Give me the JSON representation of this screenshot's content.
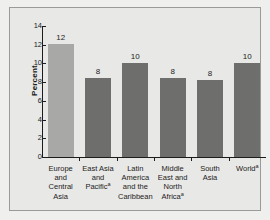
{
  "chart_data": {
    "type": "bar",
    "title": "",
    "xlabel": "",
    "ylabel": "Percent",
    "ylim": [
      0,
      14
    ],
    "ytick_values": [
      14,
      12,
      10,
      8,
      6,
      4,
      2,
      0
    ],
    "ytick_labels": [
      "14",
      "12",
      "10",
      "8",
      "6",
      "4",
      "2",
      "0"
    ],
    "grid": false,
    "legend": null,
    "categories": [
      "Europe and Central Asia",
      "East Asia and Pacific",
      "Latin America and the Caribbean",
      "Middle East and North Africa",
      "South Asia",
      "World"
    ],
    "category_lines": [
      [
        "Europe",
        "and",
        "Central Asia"
      ],
      [
        "East Asia",
        "and",
        "Pacific"
      ],
      [
        "Latin",
        "America",
        "and the",
        "Caribbean"
      ],
      [
        "Middle",
        "East and",
        "North",
        "Africa"
      ],
      [
        "South",
        "Asia"
      ],
      [
        "World"
      ]
    ],
    "category_footnote_markers": [
      "",
      "a",
      "",
      "a",
      "",
      "a"
    ],
    "values": [
      12.1,
      8.4,
      10.0,
      8.4,
      8.25,
      10.0
    ],
    "data_labels": [
      "12",
      "8",
      "10",
      "8",
      "8",
      "10"
    ],
    "bar_colors": [
      "#a8a8a6",
      "#6e6e6c",
      "#6e6e6c",
      "#6e6e6c",
      "#6e6e6c",
      "#6e6e6c"
    ],
    "background_color": "#e8e8e6",
    "axis_color": "#1c1c1c",
    "frame_color": "#9a9a98"
  }
}
